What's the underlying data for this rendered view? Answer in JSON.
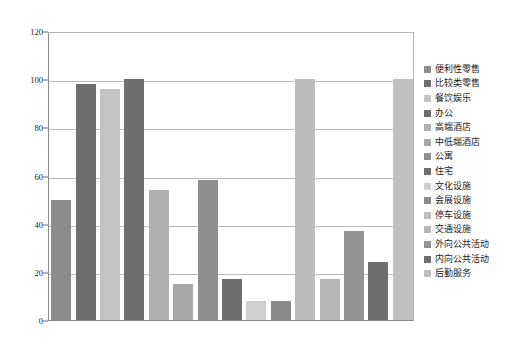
{
  "chart_data": {
    "type": "bar",
    "title": "",
    "xlabel": "",
    "ylabel": "",
    "ylim": [
      0,
      120
    ],
    "yticks": [
      0,
      20,
      40,
      60,
      80,
      100,
      120
    ],
    "ytick_labels": [
      "0",
      "20",
      "40",
      "60",
      "80",
      "100",
      "120"
    ],
    "grid": true,
    "legend_position": "right",
    "categories": [
      "便利性零售",
      "比较类零售",
      "餐饮娱乐",
      "办公",
      "高端酒店",
      "中低端酒店",
      "公寓",
      "住宅",
      "文化设施",
      "会展设施",
      "停车设施",
      "交通设施",
      "外向公共活动",
      "内向公共活动",
      "后勤服务"
    ],
    "values": [
      50,
      98,
      96,
      100,
      54,
      15,
      58,
      17,
      8,
      8,
      100,
      17,
      37,
      24,
      100
    ],
    "colors": [
      "#8c8c8c",
      "#6e6e6e",
      "#c3c3c3",
      "#6e6e6e",
      "#b0b0b0",
      "#a8a8a8",
      "#8e8e8e",
      "#6f6f6f",
      "#cfcfcf",
      "#8a8a8a",
      "#bcbcbc",
      "#b5b5b5",
      "#949494",
      "#6e6e6e",
      "#c0c0c0"
    ],
    "axis_color": "#8a8a8a",
    "grid_color": "#b9b9b9",
    "background": "#ffffff"
  },
  "legend": {
    "items": [
      {
        "label": "便利性零售",
        "color": "#8c8c8c"
      },
      {
        "label": "比较类零售",
        "color": "#6e6e6e"
      },
      {
        "label": "餐饮娱乐",
        "color": "#c3c3c3"
      },
      {
        "label": "办公",
        "color": "#6e6e6e"
      },
      {
        "label": "高端酒店",
        "color": "#b0b0b0"
      },
      {
        "label": "中低端酒店",
        "color": "#a8a8a8"
      },
      {
        "label": "公寓",
        "color": "#8e8e8e"
      },
      {
        "label": "住宅",
        "color": "#6f6f6f"
      },
      {
        "label": "文化设施",
        "color": "#cfcfcf"
      },
      {
        "label": "会展设施",
        "color": "#8a8a8a"
      },
      {
        "label": "停车设施",
        "color": "#bcbcbc"
      },
      {
        "label": "交通设施",
        "color": "#b5b5b5"
      },
      {
        "label": "外向公共活动",
        "color": "#949494"
      },
      {
        "label": "内向公共活动",
        "color": "#6e6e6e"
      },
      {
        "label": "后勤服务",
        "color": "#c0c0c0"
      }
    ]
  }
}
